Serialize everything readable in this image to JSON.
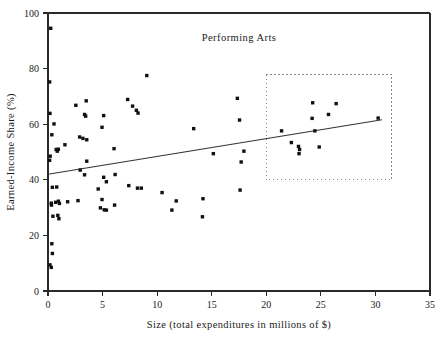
{
  "chart_data": {
    "type": "scatter",
    "title": "Performing Arts",
    "xlabel": "Size (total expenditures in millions of $)",
    "ylabel": "Earned-Income Share (%)",
    "xlim": [
      0,
      35
    ],
    "ylim": [
      0,
      100
    ],
    "xticks": [
      0,
      5,
      10,
      15,
      20,
      25,
      30,
      35
    ],
    "yticks": [
      0,
      20,
      40,
      60,
      80,
      100
    ],
    "grid": false,
    "legend": "none",
    "marker_style": "filled-square",
    "marker_color": "#111111",
    "points": [
      [
        0.25,
        94.5
      ],
      [
        0.15,
        75.2
      ],
      [
        0.18,
        63.9
      ],
      [
        0.55,
        60.1
      ],
      [
        0.35,
        56.2
      ],
      [
        0.75,
        50.9
      ],
      [
        0.85,
        50.3
      ],
      [
        0.95,
        51.0
      ],
      [
        0.2,
        48.5
      ],
      [
        0.15,
        47.0
      ],
      [
        1.55,
        52.6
      ],
      [
        2.55,
        66.8
      ],
      [
        3.5,
        68.4
      ],
      [
        3.35,
        63.5
      ],
      [
        3.45,
        62.9
      ],
      [
        2.9,
        55.4
      ],
      [
        3.2,
        54.9
      ],
      [
        3.55,
        54.4
      ],
      [
        5.1,
        63.1
      ],
      [
        4.95,
        58.9
      ],
      [
        6.05,
        51.2
      ],
      [
        7.3,
        68.9
      ],
      [
        7.75,
        66.5
      ],
      [
        8.1,
        65.0
      ],
      [
        8.25,
        64.0
      ],
      [
        9.05,
        77.5
      ],
      [
        13.35,
        58.4
      ],
      [
        15.15,
        49.4
      ],
      [
        17.35,
        69.3
      ],
      [
        17.55,
        61.5
      ],
      [
        17.95,
        50.3
      ],
      [
        17.7,
        46.4
      ],
      [
        21.4,
        57.6
      ],
      [
        22.3,
        53.4
      ],
      [
        22.95,
        52.0
      ],
      [
        23.05,
        50.9
      ],
      [
        23.0,
        49.4
      ],
      [
        24.25,
        67.7
      ],
      [
        24.2,
        62.1
      ],
      [
        24.45,
        57.6
      ],
      [
        24.85,
        51.8
      ],
      [
        25.7,
        63.5
      ],
      [
        26.4,
        67.4
      ],
      [
        30.25,
        62.2
      ],
      [
        0.4,
        37.3
      ],
      [
        0.3,
        31.6
      ],
      [
        0.32,
        30.9
      ],
      [
        0.45,
        26.9
      ],
      [
        0.8,
        37.4
      ],
      [
        0.7,
        31.9
      ],
      [
        0.95,
        32.3
      ],
      [
        1.05,
        31.5
      ],
      [
        1.0,
        26.0
      ],
      [
        0.9,
        27.2
      ],
      [
        1.8,
        32.1
      ],
      [
        2.75,
        32.5
      ],
      [
        3.55,
        46.7
      ],
      [
        2.95,
        43.5
      ],
      [
        3.35,
        41.8
      ],
      [
        4.6,
        36.7
      ],
      [
        4.95,
        32.9
      ],
      [
        5.1,
        40.9
      ],
      [
        5.35,
        39.3
      ],
      [
        6.15,
        41.9
      ],
      [
        4.8,
        29.9
      ],
      [
        5.15,
        29.2
      ],
      [
        5.35,
        29.1
      ],
      [
        6.1,
        30.9
      ],
      [
        7.4,
        37.9
      ],
      [
        8.2,
        37.0
      ],
      [
        8.55,
        37.0
      ],
      [
        10.45,
        35.4
      ],
      [
        11.35,
        29.1
      ],
      [
        11.75,
        32.4
      ],
      [
        14.2,
        33.2
      ],
      [
        14.15,
        26.7
      ],
      [
        17.6,
        36.3
      ],
      [
        0.35,
        17.0
      ],
      [
        0.4,
        13.5
      ],
      [
        0.18,
        9.4
      ],
      [
        0.3,
        8.5
      ]
    ],
    "trend_line": {
      "label": "regression-line",
      "x_start": 0.0,
      "y_start": 42.0,
      "x_end": 30.6,
      "y_end": 61.6
    },
    "annotation_box": {
      "label": "highlight-region",
      "style": "dotted-rectangle",
      "x_start": 20.0,
      "x_end": 31.5,
      "y_start": 40.0,
      "y_end": 77.8
    }
  }
}
